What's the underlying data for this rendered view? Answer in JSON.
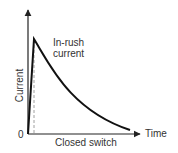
{
  "diagram": {
    "y_axis_label": "Current",
    "x_axis_label": "Time",
    "origin_label": "0",
    "peak_annotation_line1": "In-rush",
    "peak_annotation_line2": "current",
    "switch_label": "Closed switch",
    "colors": {
      "curve": "#111111",
      "axis": "#222222",
      "dashed": "#888888"
    }
  }
}
